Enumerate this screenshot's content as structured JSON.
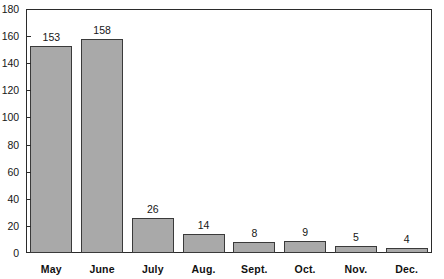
{
  "chart_data": {
    "type": "bar",
    "title": "",
    "subtitle": "",
    "xlabel": "",
    "ylabel": "",
    "categories": [
      "May",
      "June",
      "July",
      "Aug.",
      "Sept.",
      "Oct.",
      "Nov.",
      "Dec."
    ],
    "values": [
      153,
      158,
      26,
      14,
      8,
      9,
      5,
      4
    ],
    "value_labels": [
      "153",
      "158",
      "26",
      "14",
      "8",
      "9",
      "5",
      "4"
    ],
    "ylim": [
      0,
      180
    ],
    "y_ticks": [
      0,
      20,
      40,
      60,
      80,
      100,
      120,
      140,
      160,
      180
    ],
    "y_tick_labels": [
      "0",
      "20",
      "40",
      "60",
      "80",
      "100",
      "120",
      "140",
      "160",
      "180"
    ],
    "grid": false,
    "legend": null,
    "legend_position": "none",
    "bar_color": "#a9a9a9",
    "bar_edge_color": "#3a3a3a",
    "axis_color": "#2b2b2b",
    "text_color": "#161616"
  }
}
